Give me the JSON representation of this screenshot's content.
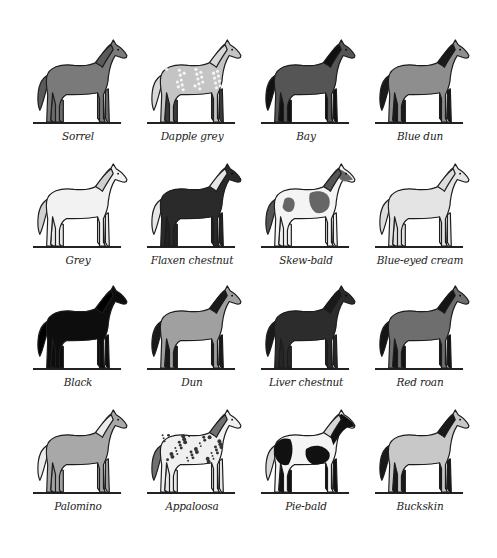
{
  "figure": {
    "title": "",
    "grid": {
      "columns": 4,
      "rows": 4
    }
  },
  "horses": [
    {
      "name": "Sorrel",
      "body": "#7a7a7a",
      "mane": "#5a5a5a",
      "legs": "#6a6a6a",
      "pattern": "solid"
    },
    {
      "name": "Dapple grey",
      "body": "#c4c4c4",
      "mane": "#d8d8d8",
      "legs": "#3a3a3a",
      "pattern": "dapple"
    },
    {
      "name": "Bay",
      "body": "#555555",
      "mane": "#111111",
      "legs": "#111111",
      "pattern": "solid"
    },
    {
      "name": "Blue dun",
      "body": "#8e8e8e",
      "mane": "#1a1a1a",
      "legs": "#1a1a1a",
      "pattern": "solid"
    },
    {
      "name": "Grey",
      "body": "#f2f2f2",
      "mane": "#d0d0d0",
      "legs": "#e8e8e8",
      "pattern": "solid"
    },
    {
      "name": "Flaxen chestnut",
      "body": "#2a2a2a",
      "mane": "#e6e6e6",
      "legs": "#222222",
      "pattern": "solid"
    },
    {
      "name": "Skew-bald",
      "body": "#f4f4f4",
      "mane": "#555555",
      "legs": "#f0f0f0",
      "pattern": "skewbald"
    },
    {
      "name": "Blue-eyed cream",
      "body": "#e4e4e4",
      "mane": "#dddddd",
      "legs": "#e0e0e0",
      "pattern": "solid"
    },
    {
      "name": "Black",
      "body": "#0d0d0d",
      "mane": "#000000",
      "legs": "#0d0d0d",
      "pattern": "solid"
    },
    {
      "name": "Dun",
      "body": "#a0a0a0",
      "mane": "#1a1a1a",
      "legs": "#1a1a1a",
      "pattern": "solid"
    },
    {
      "name": "Liver chestnut",
      "body": "#2c2c2c",
      "mane": "#1a1a1a",
      "legs": "#262626",
      "pattern": "solid"
    },
    {
      "name": "Red roan",
      "body": "#6e6e6e",
      "mane": "#151515",
      "legs": "#151515",
      "pattern": "solid"
    },
    {
      "name": "Palomino",
      "body": "#a8a8a8",
      "mane": "#ececec",
      "legs": "#a0a0a0",
      "pattern": "solid"
    },
    {
      "name": "Appaloosa",
      "body": "#f0f0f0",
      "mane": "#707070",
      "legs": "#e6e6e6",
      "pattern": "appaloosa"
    },
    {
      "name": "Pie-bald",
      "body": "#f4f4f4",
      "mane": "#d8d8d8",
      "legs": "#111111",
      "pattern": "piebald"
    },
    {
      "name": "Buckskin",
      "body": "#c8c8c8",
      "mane": "#1a1a1a",
      "legs": "#1a1a1a",
      "pattern": "solid"
    }
  ]
}
